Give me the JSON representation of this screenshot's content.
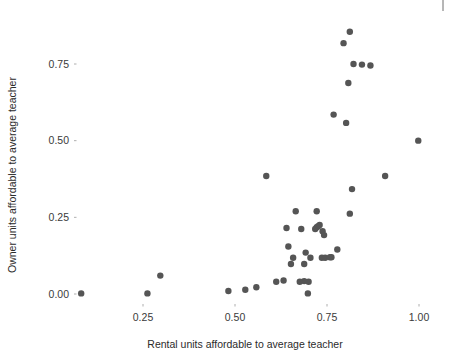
{
  "chart_data": {
    "type": "scatter",
    "title": "",
    "subtitle": "",
    "xlabel": "Rental units affordable to average teacher",
    "ylabel": "Owner units affordable to average teacher",
    "xlim": [
      0.06,
      1.06
    ],
    "ylim": [
      -0.03,
      0.9
    ],
    "xticks": [
      0.25,
      0.5,
      0.75,
      1.0
    ],
    "xtick_labels": [
      "0.25",
      "0.50",
      "0.75",
      "1.00"
    ],
    "yticks": [
      0.0,
      0.25,
      0.5,
      0.75
    ],
    "ytick_labels": [
      "0.00",
      "0.25",
      "0.50",
      "0.75"
    ],
    "grid": false,
    "legend": null,
    "legend_position": "none",
    "point_color": "#555555",
    "point_size": 3.2,
    "background_color": "#ffffff",
    "n_points": 46,
    "x": [
      0.082,
      0.262,
      0.297,
      0.482,
      0.528,
      0.558,
      0.585,
      0.612,
      0.618,
      0.632,
      0.64,
      0.645,
      0.652,
      0.658,
      0.662,
      0.668,
      0.672,
      0.678,
      0.684,
      0.69,
      0.695,
      0.7,
      0.702,
      0.708,
      0.712,
      0.718,
      0.722,
      0.728,
      0.732,
      0.738,
      0.742,
      0.748,
      0.752,
      0.762,
      0.768,
      0.775,
      0.782,
      0.792,
      0.802,
      0.812,
      0.822,
      0.832,
      0.845,
      0.872,
      0.908,
      0.998
    ],
    "y": [
      0.002,
      0.002,
      0.06,
      0.01,
      0.014,
      0.022,
      0.385,
      0.04,
      0.044,
      0.215,
      0.155,
      0.098,
      0.118,
      0.27,
      0.042,
      0.135,
      0.002,
      0.212,
      0.218,
      0.221,
      0.225,
      0.27,
      0.205,
      0.192,
      0.118,
      0.118,
      0.585,
      0.145,
      0.818,
      0.262,
      0.688,
      0.75,
      0.342,
      0.558,
      0.855,
      0.735,
      0.748,
      0.385,
      0.268,
      0.5,
      0.142,
      0.222,
      0.12,
      0.118,
      0.198,
      0.118
    ],
    "points": [
      {
        "x": 0.082,
        "y": 0.002
      },
      {
        "x": 0.262,
        "y": 0.002
      },
      {
        "x": 0.297,
        "y": 0.06
      },
      {
        "x": 0.482,
        "y": 0.01
      },
      {
        "x": 0.528,
        "y": 0.014
      },
      {
        "x": 0.558,
        "y": 0.022
      },
      {
        "x": 0.585,
        "y": 0.385
      },
      {
        "x": 0.612,
        "y": 0.04
      },
      {
        "x": 0.632,
        "y": 0.044
      },
      {
        "x": 0.64,
        "y": 0.215
      },
      {
        "x": 0.645,
        "y": 0.155
      },
      {
        "x": 0.652,
        "y": 0.098
      },
      {
        "x": 0.658,
        "y": 0.118
      },
      {
        "x": 0.665,
        "y": 0.27
      },
      {
        "x": 0.688,
        "y": 0.042
      },
      {
        "x": 0.692,
        "y": 0.135
      },
      {
        "x": 0.698,
        "y": 0.002
      },
      {
        "x": 0.718,
        "y": 0.212
      },
      {
        "x": 0.722,
        "y": 0.218
      },
      {
        "x": 0.726,
        "y": 0.221
      },
      {
        "x": 0.73,
        "y": 0.225
      },
      {
        "x": 0.722,
        "y": 0.27
      },
      {
        "x": 0.738,
        "y": 0.205
      },
      {
        "x": 0.742,
        "y": 0.192
      },
      {
        "x": 0.736,
        "y": 0.118
      },
      {
        "x": 0.745,
        "y": 0.118
      },
      {
        "x": 0.768,
        "y": 0.585
      },
      {
        "x": 0.778,
        "y": 0.145
      },
      {
        "x": 0.795,
        "y": 0.818
      },
      {
        "x": 0.812,
        "y": 0.262
      },
      {
        "x": 0.808,
        "y": 0.688
      },
      {
        "x": 0.822,
        "y": 0.75
      },
      {
        "x": 0.818,
        "y": 0.342
      },
      {
        "x": 0.802,
        "y": 0.558
      },
      {
        "x": 0.812,
        "y": 0.855
      },
      {
        "x": 0.845,
        "y": 0.748
      },
      {
        "x": 0.868,
        "y": 0.745
      },
      {
        "x": 0.908,
        "y": 0.385
      },
      {
        "x": 0.998,
        "y": 0.5
      },
      {
        "x": 0.762,
        "y": 0.12
      },
      {
        "x": 0.758,
        "y": 0.12
      },
      {
        "x": 0.705,
        "y": 0.118
      },
      {
        "x": 0.7,
        "y": 0.04
      },
      {
        "x": 0.676,
        "y": 0.04
      },
      {
        "x": 0.688,
        "y": 0.098
      },
      {
        "x": 0.68,
        "y": 0.212
      }
    ]
  },
  "axes": {
    "x_title": "Rental units affordable to average teacher",
    "y_title": "Owner units affordable to average teacher",
    "x_tick_labels": [
      "0.25",
      "0.50",
      "0.75",
      "1.00"
    ],
    "y_tick_labels": [
      "0.00",
      "0.25",
      "0.50",
      "0.75"
    ]
  }
}
